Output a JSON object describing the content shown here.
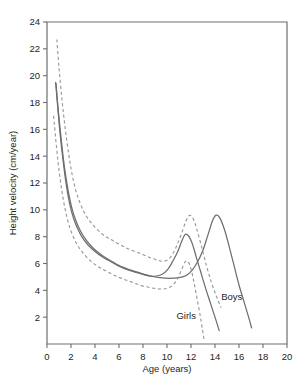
{
  "chart_data": {
    "type": "line",
    "title": "",
    "xlabel": "Age (years)",
    "ylabel": "Height velocity (cm/year)",
    "xlim": [
      0,
      20
    ],
    "ylim": [
      0,
      24
    ],
    "xticks": [
      0,
      2,
      4,
      6,
      8,
      10,
      12,
      14,
      16,
      18,
      20
    ],
    "yticks": [
      2,
      4,
      6,
      8,
      10,
      12,
      14,
      16,
      18,
      20,
      22,
      24
    ],
    "grid": false,
    "legend_position": "inline-annotations",
    "annotations": [
      {
        "text": "Boys",
        "x": 15.4,
        "y": 3.3
      },
      {
        "text": "Girls",
        "x": 11.6,
        "y": 1.9
      }
    ],
    "colors": {
      "solid_curve": "#6d6e71",
      "dashed_curve": "#939598",
      "axis": "#6d6e71",
      "text": "#231f20",
      "background": "#ffffff"
    },
    "series": [
      {
        "name": "Girls (median)",
        "style": "solid",
        "points": [
          [
            0.72,
            19.5
          ],
          [
            0.9,
            17.6
          ],
          [
            1.1,
            15.6
          ],
          [
            1.35,
            13.6
          ],
          [
            1.6,
            11.9
          ],
          [
            1.9,
            10.4
          ],
          [
            2.2,
            9.4
          ],
          [
            2.5,
            8.7
          ],
          [
            2.9,
            8.0
          ],
          [
            3.4,
            7.4
          ],
          [
            4.0,
            6.9
          ],
          [
            4.6,
            6.5
          ],
          [
            5.2,
            6.2
          ],
          [
            6.0,
            5.8
          ],
          [
            6.8,
            5.5
          ],
          [
            7.6,
            5.3
          ],
          [
            8.4,
            5.1
          ],
          [
            9.0,
            5.05
          ],
          [
            9.6,
            5.2
          ],
          [
            10.1,
            5.6
          ],
          [
            10.5,
            6.2
          ],
          [
            10.9,
            6.9
          ],
          [
            11.2,
            7.6
          ],
          [
            11.5,
            8.15
          ],
          [
            11.8,
            8.05
          ],
          [
            12.1,
            7.5
          ],
          [
            12.4,
            6.6
          ],
          [
            12.8,
            5.4
          ],
          [
            13.2,
            4.2
          ],
          [
            13.6,
            3.1
          ],
          [
            14.0,
            2.0
          ],
          [
            14.35,
            1.0
          ]
        ]
      },
      {
        "name": "Boys (median)",
        "style": "solid",
        "points": [
          [
            0.75,
            19.4
          ],
          [
            0.95,
            17.3
          ],
          [
            1.2,
            15.1
          ],
          [
            1.45,
            13.2
          ],
          [
            1.75,
            11.5
          ],
          [
            2.05,
            10.2
          ],
          [
            2.4,
            9.2
          ],
          [
            2.8,
            8.4
          ],
          [
            3.3,
            7.7
          ],
          [
            3.9,
            7.1
          ],
          [
            4.6,
            6.6
          ],
          [
            5.3,
            6.2
          ],
          [
            6.1,
            5.8
          ],
          [
            7.0,
            5.5
          ],
          [
            7.9,
            5.25
          ],
          [
            8.7,
            5.05
          ],
          [
            9.4,
            4.95
          ],
          [
            10.2,
            4.9
          ],
          [
            11.0,
            4.95
          ],
          [
            11.6,
            5.1
          ],
          [
            12.1,
            5.5
          ],
          [
            12.6,
            6.2
          ],
          [
            13.0,
            7.0
          ],
          [
            13.4,
            8.1
          ],
          [
            13.8,
            9.2
          ],
          [
            14.1,
            9.6
          ],
          [
            14.4,
            9.4
          ],
          [
            14.8,
            8.5
          ],
          [
            15.2,
            7.2
          ],
          [
            15.6,
            5.8
          ],
          [
            16.0,
            4.4
          ],
          [
            16.4,
            3.2
          ],
          [
            16.8,
            2.0
          ],
          [
            17.05,
            1.2
          ]
        ]
      },
      {
        "name": "Girls 97th centile (upper dashed)",
        "style": "dashed",
        "points": [
          [
            0.82,
            22.7
          ],
          [
            1.0,
            20.6
          ],
          [
            1.25,
            18.2
          ],
          [
            1.5,
            16.2
          ],
          [
            1.8,
            14.2
          ],
          [
            2.1,
            12.6
          ],
          [
            2.45,
            11.3
          ],
          [
            2.85,
            10.3
          ],
          [
            3.3,
            9.5
          ],
          [
            3.9,
            8.8
          ],
          [
            4.6,
            8.2
          ],
          [
            5.3,
            7.8
          ],
          [
            6.1,
            7.4
          ],
          [
            7.0,
            7.0
          ],
          [
            7.9,
            6.7
          ],
          [
            8.7,
            6.4
          ],
          [
            9.4,
            6.2
          ],
          [
            9.9,
            6.2
          ],
          [
            10.4,
            6.6
          ],
          [
            10.8,
            7.3
          ],
          [
            11.2,
            8.2
          ],
          [
            11.6,
            9.2
          ],
          [
            11.9,
            9.6
          ],
          [
            12.2,
            9.3
          ],
          [
            12.5,
            8.5
          ],
          [
            12.9,
            7.2
          ],
          [
            13.3,
            5.8
          ],
          [
            13.7,
            4.6
          ],
          [
            14.1,
            3.6
          ],
          [
            14.5,
            2.7
          ]
        ]
      },
      {
        "name": "Girls 3rd centile (lower dashed)",
        "style": "dashed",
        "points": [
          [
            0.55,
            17.0
          ],
          [
            0.8,
            14.6
          ],
          [
            1.05,
            12.6
          ],
          [
            1.35,
            10.8
          ],
          [
            1.7,
            9.3
          ],
          [
            2.05,
            8.3
          ],
          [
            2.45,
            7.5
          ],
          [
            2.9,
            6.9
          ],
          [
            3.5,
            6.3
          ],
          [
            4.2,
            5.8
          ],
          [
            5.0,
            5.4
          ],
          [
            5.9,
            5.0
          ],
          [
            6.8,
            4.7
          ],
          [
            7.7,
            4.4
          ],
          [
            8.6,
            4.2
          ],
          [
            9.4,
            4.1
          ],
          [
            10.0,
            4.15
          ],
          [
            10.5,
            4.4
          ],
          [
            10.9,
            4.9
          ],
          [
            11.2,
            5.5
          ],
          [
            11.5,
            6.1
          ],
          [
            11.75,
            6.15
          ],
          [
            12.0,
            5.6
          ],
          [
            12.25,
            4.6
          ],
          [
            12.5,
            3.4
          ],
          [
            12.75,
            2.2
          ],
          [
            12.95,
            1.1
          ],
          [
            13.1,
            0.3
          ]
        ]
      }
    ]
  }
}
